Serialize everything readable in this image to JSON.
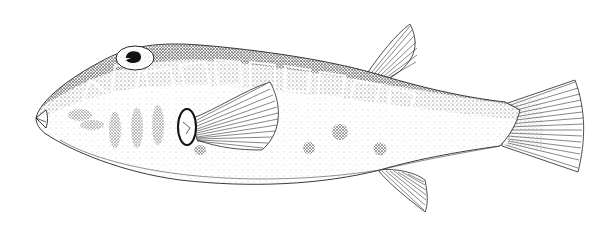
{
  "image": {
    "subject": "Pufferfish scientific illustration",
    "style": "stippled pen-and-ink line drawing",
    "orientation": "facing left",
    "colors": {
      "background": "#ffffff",
      "ink": "#111111",
      "stipple_dark": "#222222",
      "stipple_light": "#888888"
    },
    "features": [
      {
        "name": "snout",
        "label": "beak-like mouth"
      },
      {
        "name": "eye",
        "label": "eye with dark pupil"
      },
      {
        "name": "reticulated-pattern",
        "label": "polygonal reticulated dorsal pattern"
      },
      {
        "name": "pectoral-fin",
        "label": "pectoral fin"
      },
      {
        "name": "dorsal-fin",
        "label": "dorsal fin"
      },
      {
        "name": "anal-fin",
        "label": "anal fin"
      },
      {
        "name": "caudal-fin",
        "label": "caudal (tail) fin"
      },
      {
        "name": "lateral-spots",
        "label": "dark lateral spots"
      }
    ]
  }
}
